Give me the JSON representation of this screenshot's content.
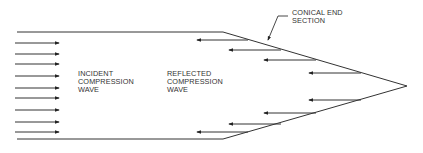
{
  "diagram": {
    "labels": {
      "incident": [
        "INCIDENT",
        "COMPRESSION",
        "WAVE"
      ],
      "reflected": [
        "REFLECTED",
        "COMPRESSION",
        "WAVE"
      ],
      "conical": [
        "CONICAL END",
        "SECTION"
      ]
    },
    "colors": {
      "line": "#333333",
      "text": "#333333"
    },
    "incident_arrows_y": [
      43,
      54,
      64,
      76,
      88,
      98,
      110,
      122,
      132
    ],
    "reflected_arrows": [
      {
        "y": 40,
        "x1": 197,
        "x2": 248
      },
      {
        "y": 50,
        "x1": 229,
        "x2": 281
      },
      {
        "y": 60,
        "x1": 264,
        "x2": 316
      },
      {
        "y": 73,
        "x1": 309,
        "x2": 361
      },
      {
        "y": 100,
        "x1": 309,
        "x2": 361
      },
      {
        "y": 113,
        "x1": 264,
        "x2": 316
      },
      {
        "y": 124,
        "x1": 229,
        "x2": 281
      },
      {
        "y": 132,
        "x1": 197,
        "x2": 248
      }
    ]
  }
}
